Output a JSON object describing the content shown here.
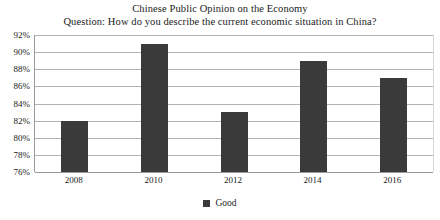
{
  "chart_data": {
    "type": "bar",
    "title": "Chinese Public Opinion on the Economy",
    "subtitle": "Question: How do you describe the current economic situation in China?",
    "categories": [
      "2008",
      "2010",
      "2012",
      "2014",
      "2016"
    ],
    "series": [
      {
        "name": "Good",
        "values": [
          82,
          91,
          83,
          89,
          87
        ]
      }
    ],
    "values": [
      82,
      91,
      83,
      89,
      87
    ],
    "ytick_labels": [
      "92%",
      "90%",
      "88%",
      "86%",
      "84%",
      "82%",
      "80%",
      "78%",
      "76%"
    ],
    "ytick_values": [
      92,
      90,
      88,
      86,
      84,
      82,
      80,
      78,
      76
    ],
    "ylim": [
      76,
      92
    ],
    "xlabel": "",
    "ylabel": "",
    "grid": true,
    "legend_position": "bottom",
    "legend": [
      "Good"
    ],
    "colors": {
      "bar": "#3a3a3a",
      "gridline": "#b4b4b4",
      "axis": "#9a9a9a",
      "text": "#1a1a1a",
      "background": "#ffffff"
    }
  }
}
